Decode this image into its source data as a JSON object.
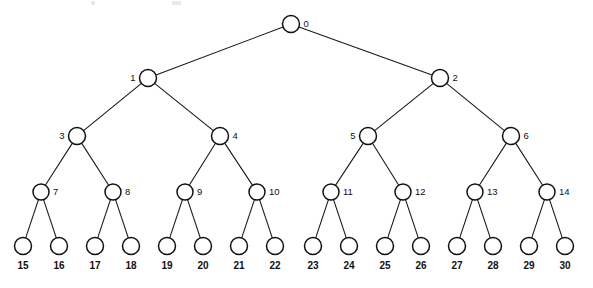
{
  "figure": {
    "type": "binary-tree-diagram",
    "background_color": "#ffffff",
    "stroke_color": "#111111",
    "label_color": "#111111",
    "levels": 5,
    "node_count": 31
  },
  "nodes": [
    {
      "id": "0",
      "label": "0",
      "x": 291,
      "y": 24,
      "r": 8.5,
      "level": 0,
      "label_pos": "right"
    },
    {
      "id": "1",
      "label": "1",
      "x": 148,
      "y": 78,
      "r": 8.5,
      "level": 1,
      "label_pos": "left"
    },
    {
      "id": "2",
      "label": "2",
      "x": 440,
      "y": 78,
      "r": 8.5,
      "level": 1,
      "label_pos": "right"
    },
    {
      "id": "3",
      "label": "3",
      "x": 77,
      "y": 136,
      "r": 8.5,
      "level": 2,
      "label_pos": "left"
    },
    {
      "id": "4",
      "label": "4",
      "x": 220,
      "y": 136,
      "r": 8.5,
      "level": 2,
      "label_pos": "right"
    },
    {
      "id": "5",
      "label": "5",
      "x": 368,
      "y": 136,
      "r": 8.5,
      "level": 2,
      "label_pos": "left"
    },
    {
      "id": "6",
      "label": "6",
      "x": 511,
      "y": 136,
      "r": 8.5,
      "level": 2,
      "label_pos": "right"
    },
    {
      "id": "7",
      "label": "7",
      "x": 41,
      "y": 192,
      "r": 8.0,
      "level": 3,
      "label_pos": "right"
    },
    {
      "id": "8",
      "label": "8",
      "x": 113,
      "y": 192,
      "r": 8.0,
      "level": 3,
      "label_pos": "right"
    },
    {
      "id": "9",
      "label": "9",
      "x": 185,
      "y": 192,
      "r": 8.0,
      "level": 3,
      "label_pos": "right"
    },
    {
      "id": "10",
      "label": "10",
      "x": 257,
      "y": 192,
      "r": 8.0,
      "level": 3,
      "label_pos": "right"
    },
    {
      "id": "11",
      "label": "11",
      "x": 331,
      "y": 192,
      "r": 8.0,
      "level": 3,
      "label_pos": "right"
    },
    {
      "id": "12",
      "label": "12",
      "x": 403,
      "y": 192,
      "r": 8.0,
      "level": 3,
      "label_pos": "right"
    },
    {
      "id": "13",
      "label": "13",
      "x": 475,
      "y": 192,
      "r": 8.0,
      "level": 3,
      "label_pos": "right"
    },
    {
      "id": "14",
      "label": "14",
      "x": 547,
      "y": 192,
      "r": 8.0,
      "level": 3,
      "label_pos": "right"
    },
    {
      "id": "15",
      "label": "15",
      "x": 23,
      "y": 246,
      "r": 8.5,
      "level": 4,
      "label_pos": "below"
    },
    {
      "id": "16",
      "label": "16",
      "x": 59,
      "y": 246,
      "r": 8.5,
      "level": 4,
      "label_pos": "below"
    },
    {
      "id": "17",
      "label": "17",
      "x": 95,
      "y": 246,
      "r": 8.5,
      "level": 4,
      "label_pos": "below"
    },
    {
      "id": "18",
      "label": "18",
      "x": 131,
      "y": 246,
      "r": 8.5,
      "level": 4,
      "label_pos": "below"
    },
    {
      "id": "19",
      "label": "19",
      "x": 167,
      "y": 246,
      "r": 8.5,
      "level": 4,
      "label_pos": "below"
    },
    {
      "id": "20",
      "label": "20",
      "x": 203,
      "y": 246,
      "r": 8.5,
      "level": 4,
      "label_pos": "below"
    },
    {
      "id": "21",
      "label": "21",
      "x": 239,
      "y": 246,
      "r": 8.5,
      "level": 4,
      "label_pos": "below"
    },
    {
      "id": "22",
      "label": "22",
      "x": 275,
      "y": 246,
      "r": 8.5,
      "level": 4,
      "label_pos": "below"
    },
    {
      "id": "23",
      "label": "23",
      "x": 313,
      "y": 246,
      "r": 8.5,
      "level": 4,
      "label_pos": "below"
    },
    {
      "id": "24",
      "label": "24",
      "x": 349,
      "y": 246,
      "r": 8.5,
      "level": 4,
      "label_pos": "below"
    },
    {
      "id": "25",
      "label": "25",
      "x": 385,
      "y": 246,
      "r": 8.5,
      "level": 4,
      "label_pos": "below"
    },
    {
      "id": "26",
      "label": "26",
      "x": 421,
      "y": 246,
      "r": 8.5,
      "level": 4,
      "label_pos": "below"
    },
    {
      "id": "27",
      "label": "27",
      "x": 457,
      "y": 246,
      "r": 8.5,
      "level": 4,
      "label_pos": "below"
    },
    {
      "id": "28",
      "label": "28",
      "x": 493,
      "y": 246,
      "r": 8.5,
      "level": 4,
      "label_pos": "below"
    },
    {
      "id": "29",
      "label": "29",
      "x": 529,
      "y": 246,
      "r": 8.5,
      "level": 4,
      "label_pos": "below"
    },
    {
      "id": "30",
      "label": "30",
      "x": 565,
      "y": 246,
      "r": 8.5,
      "level": 4,
      "label_pos": "below"
    }
  ],
  "edges": [
    {
      "from": "0",
      "to": "1"
    },
    {
      "from": "0",
      "to": "2"
    },
    {
      "from": "1",
      "to": "3"
    },
    {
      "from": "1",
      "to": "4"
    },
    {
      "from": "2",
      "to": "5"
    },
    {
      "from": "2",
      "to": "6"
    },
    {
      "from": "3",
      "to": "7"
    },
    {
      "from": "3",
      "to": "8"
    },
    {
      "from": "4",
      "to": "9"
    },
    {
      "from": "4",
      "to": "10"
    },
    {
      "from": "5",
      "to": "11"
    },
    {
      "from": "5",
      "to": "12"
    },
    {
      "from": "6",
      "to": "13"
    },
    {
      "from": "6",
      "to": "14"
    },
    {
      "from": "7",
      "to": "15"
    },
    {
      "from": "7",
      "to": "16"
    },
    {
      "from": "8",
      "to": "17"
    },
    {
      "from": "8",
      "to": "18"
    },
    {
      "from": "9",
      "to": "19"
    },
    {
      "from": "9",
      "to": "20"
    },
    {
      "from": "10",
      "to": "21"
    },
    {
      "from": "10",
      "to": "22"
    },
    {
      "from": "11",
      "to": "23"
    },
    {
      "from": "11",
      "to": "24"
    },
    {
      "from": "12",
      "to": "25"
    },
    {
      "from": "12",
      "to": "26"
    },
    {
      "from": "13",
      "to": "27"
    },
    {
      "from": "13",
      "to": "28"
    },
    {
      "from": "14",
      "to": "29"
    },
    {
      "from": "14",
      "to": "30"
    }
  ]
}
